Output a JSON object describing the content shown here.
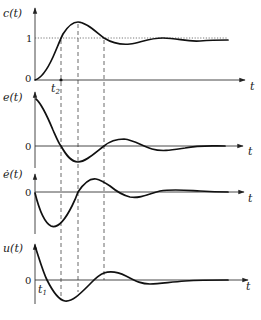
{
  "figure": {
    "time_axis_label": "t",
    "panels": [
      {
        "id": "c",
        "ylabel": "c(t)",
        "zero_label": "0",
        "level_label": "1",
        "marker_label": "t",
        "marker_sub": "2"
      },
      {
        "id": "e",
        "ylabel": "e(t)",
        "zero_label": "0"
      },
      {
        "id": "edot",
        "ylabel": "ė(t)",
        "zero_label": "0"
      },
      {
        "id": "u",
        "ylabel": "u(t)",
        "zero_label": "0",
        "marker_label": "t",
        "marker_sub": "1"
      }
    ],
    "guide_lines": [
      "c(t) crosses 1 (t2)",
      "c(t) peak / e(t) minimum",
      "c(t) crosses 1 again / e(t) zero"
    ]
  },
  "colors": {
    "curve": "#111111",
    "axis": "#333333",
    "guide": "#444444",
    "background": "#ffffff"
  }
}
